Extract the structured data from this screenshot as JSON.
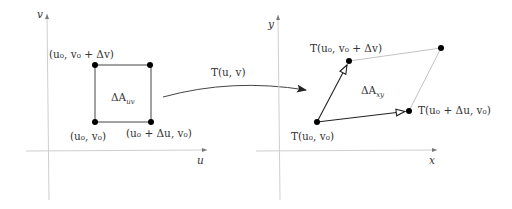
{
  "left_plot": {
    "axis_x_label": "u",
    "axis_y_label": "v",
    "region_label": "ΔA",
    "region_label_sub": "uv",
    "corners": {
      "bottom_left": "(u₀, v₀)",
      "bottom_right": "(u₀ + Δu, v₀)",
      "top_left": "(u₀, v₀ + Δv)"
    }
  },
  "transform": {
    "label": "T(u, v)"
  },
  "right_plot": {
    "axis_x_label": "x",
    "axis_y_label": "y",
    "region_label": "ΔA",
    "region_label_sub": "xy",
    "corners": {
      "origin": "T(u₀, v₀)",
      "u_step": "T(u₀ + Δu, v₀)",
      "v_step": "T(u₀, v₀ + Δv)"
    }
  },
  "colors": {
    "axis": "#cfcfcf",
    "line": "#555555",
    "dashed_edge": "#bbbbbb",
    "point": "#000000",
    "text": "#333333"
  }
}
